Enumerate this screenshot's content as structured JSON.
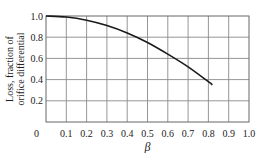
{
  "chart_data": {
    "type": "line",
    "title": "",
    "xlabel": "β",
    "ylabel_lines": [
      "Loss, fraction of",
      "orifice differential"
    ],
    "xlim": [
      0,
      1.0
    ],
    "ylim": [
      0,
      1.0
    ],
    "grid": true,
    "x_ticks": [
      0,
      0.1,
      0.2,
      0.3,
      0.4,
      0.5,
      0.6,
      0.7,
      0.8,
      0.9,
      1.0
    ],
    "x_tick_labels": [
      "0",
      "0.1",
      "0.2",
      "0.3",
      "0.4",
      "0.5",
      "0.6",
      "0.7",
      "0.8",
      "0.9",
      "1.0"
    ],
    "y_ticks": [
      0.2,
      0.4,
      0.6,
      0.8,
      1.0
    ],
    "y_tick_labels": [
      "0.2",
      "0.4",
      "0.6",
      "0.8",
      "1.0"
    ],
    "origin_label": "0",
    "series": [
      {
        "name": "Permanent pressure loss",
        "x": [
          0,
          0.1,
          0.2,
          0.3,
          0.4,
          0.5,
          0.6,
          0.7,
          0.8,
          0.82
        ],
        "y": [
          1.0,
          0.99,
          0.96,
          0.91,
          0.84,
          0.75,
          0.64,
          0.52,
          0.38,
          0.35
        ]
      }
    ]
  }
}
